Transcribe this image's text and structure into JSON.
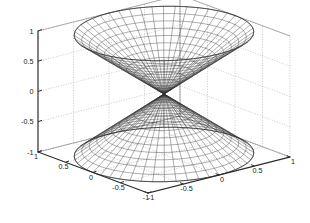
{
  "figure": {
    "title": "",
    "background_color": "#ffffff",
    "mesh_color": "#303030",
    "grid_color": "#9a9a9a",
    "axis_color": "#2b2b2b",
    "tick_text_color": "#1a1a1a"
  },
  "chart_data": {
    "type": "surface",
    "subtype": "mesh-wireframe-3d",
    "title": "",
    "xlabel": "",
    "ylabel": "",
    "zlabel": "",
    "xlim": [
      -1,
      1
    ],
    "ylim": [
      -1,
      1
    ],
    "zlim": [
      -1,
      1
    ],
    "xticks": [
      -1,
      -0.5,
      0,
      0.5,
      1
    ],
    "yticks": [
      -1,
      -0.5,
      0,
      0.5,
      1
    ],
    "zticks": [
      -1,
      -0.5,
      0,
      0.5,
      1
    ],
    "xtick_labels": [
      "-1",
      "-0.5",
      "0",
      "0.5",
      "1"
    ],
    "ytick_labels": [
      "1",
      "0.5",
      "0",
      "-0.5",
      "-1"
    ],
    "ztick_labels": [
      "1",
      "0.5",
      "0",
      "-0.5",
      "-1"
    ],
    "grid": true,
    "grid_style": "dotted",
    "legend": null,
    "view": {
      "azimuth": -37.5,
      "elevation": 20
    },
    "surface": {
      "equation": "z = sqrt(x^2 + y^2) and z = -sqrt(x^2 + y^2)",
      "parametric": "x = r*cos(theta), y = r*sin(theta), z = ±r",
      "radial_divisions": 12,
      "angular_divisions": 48,
      "sheets": [
        {
          "name": "upper-cone",
          "z_range": [
            0,
            1
          ],
          "apex": [
            0,
            0,
            0
          ]
        },
        {
          "name": "lower-cone",
          "z_range": [
            -1,
            0
          ],
          "apex": [
            0,
            0,
            0
          ]
        }
      ]
    }
  },
  "axes": {
    "z_axis": {
      "name": "z-axis",
      "ticks": [
        {
          "value": 1,
          "label": "1"
        },
        {
          "value": 0.5,
          "label": "0.5"
        },
        {
          "value": 0,
          "label": "0"
        },
        {
          "value": -0.5,
          "label": "-0.5"
        },
        {
          "value": -1,
          "label": "-1"
        }
      ]
    },
    "y_axis": {
      "name": "y-axis",
      "ticks": [
        {
          "value": 1,
          "label": "1"
        },
        {
          "value": 0.5,
          "label": "0.5"
        },
        {
          "value": 0,
          "label": "0"
        },
        {
          "value": -0.5,
          "label": "-0.5"
        },
        {
          "value": -1,
          "label": "-1"
        }
      ]
    },
    "x_axis": {
      "name": "x-axis",
      "ticks": [
        {
          "value": -1,
          "label": "-1"
        },
        {
          "value": -0.5,
          "label": "-0.5"
        },
        {
          "value": 0,
          "label": "0"
        },
        {
          "value": 0.5,
          "label": "0.5"
        },
        {
          "value": 1,
          "label": "1"
        }
      ]
    }
  }
}
